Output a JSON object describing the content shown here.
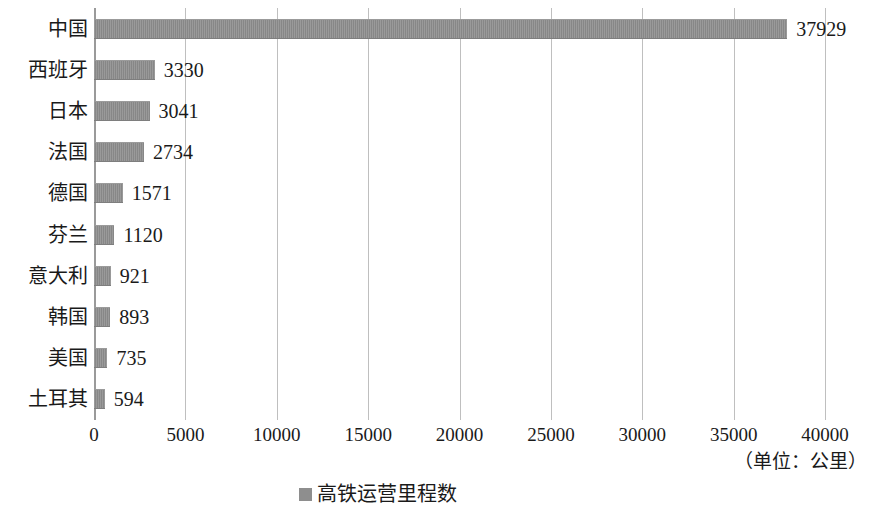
{
  "chart_data": {
    "type": "bar",
    "orientation": "horizontal",
    "title": "",
    "subtitle": "",
    "xlabel": "",
    "ylabel": "",
    "categories": [
      "中国",
      "西班牙",
      "日本",
      "法国",
      "德国",
      "芬兰",
      "意大利",
      "韩国",
      "美国",
      "土耳其"
    ],
    "values": [
      37929,
      3330,
      3041,
      2734,
      1571,
      1120,
      921,
      893,
      735,
      594
    ],
    "series": [
      {
        "name": "高铁运营里程数",
        "values": [
          37929,
          3330,
          3041,
          2734,
          1571,
          1120,
          921,
          893,
          735,
          594
        ]
      }
    ],
    "xlim": [
      0,
      40000
    ],
    "xticks": [
      0,
      5000,
      10000,
      15000,
      20000,
      25000,
      30000,
      35000,
      40000
    ],
    "xtick_labels": [
      "0",
      "5000",
      "10000",
      "15000",
      "20000",
      "25000",
      "30000",
      "35000",
      "40000"
    ],
    "grid": "vertical",
    "legend_position": "bottom",
    "data_labels_shown": true,
    "bar_color": "#8e8e8e",
    "gridline_color": "#bfbfbf",
    "axis_color": "#9a9a9a",
    "unit_note": "（单位：公里）"
  },
  "legend": {
    "items": [
      {
        "label": "高铁运营里程数",
        "color": "#8e8e8e",
        "marker": "square-marker"
      }
    ]
  },
  "axis": {
    "unit_note": "（单位：公里）"
  }
}
